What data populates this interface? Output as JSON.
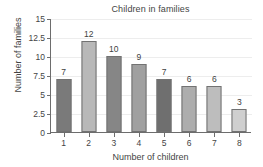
{
  "chart_data": {
    "type": "bar",
    "title": "Children in families",
    "xlabel": "Number of children",
    "ylabel": "Number of families",
    "categories": [
      "1",
      "2",
      "3",
      "4",
      "5",
      "6",
      "7",
      "8"
    ],
    "values": [
      7,
      12,
      10,
      9,
      7,
      6,
      6,
      3
    ],
    "value_labels": [
      "7",
      "12",
      "10",
      "9",
      "7",
      "6",
      "6",
      "3"
    ],
    "bar_colors": [
      "#7a7a7a",
      "#b8b8b8",
      "#868686",
      "#a0a0a0",
      "#6f6f6f",
      "#adadad",
      "#bdbdbd",
      "#cfcfcf"
    ],
    "bar_border_color": "#727272",
    "ylim": [
      0,
      15
    ],
    "yticks": [
      0,
      2.5,
      5,
      7.5,
      10,
      12.5,
      15
    ],
    "ytick_labels": [
      "0",
      "2.5",
      "5",
      "7.5",
      "10",
      "12.5",
      "15"
    ],
    "grid": true,
    "gridline_color": "#ededed",
    "axis_color": "#6d6d6d",
    "legend": null,
    "background": "#ffffff"
  }
}
